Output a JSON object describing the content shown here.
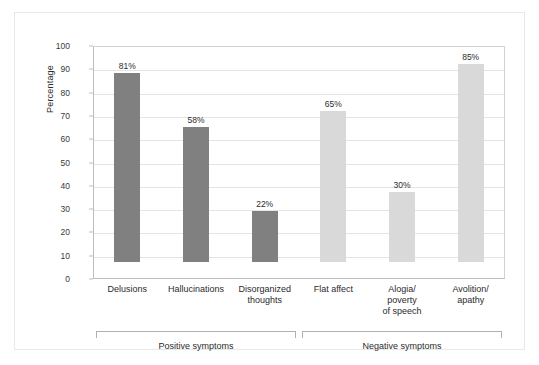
{
  "chart_data": {
    "type": "bar",
    "title": "",
    "xlabel": "",
    "ylabel": "Percentage",
    "ylim": [
      0,
      100
    ],
    "ytick_step": 10,
    "grid": true,
    "legend": "none",
    "categories": [
      "Delusions",
      "Hallucinations",
      "Disorganized thoughts",
      "Flat affect",
      "Alogia/ poverty of speech",
      "Avolition/ apathy"
    ],
    "category_lines": [
      [
        "Delusions"
      ],
      [
        "Hallucinations"
      ],
      [
        "Disorganized",
        "thoughts"
      ],
      [
        "Flat affect"
      ],
      [
        "Alogia/",
        "poverty",
        "of speech"
      ],
      [
        "Avolition/",
        "apathy"
      ]
    ],
    "values": [
      81,
      58,
      22,
      65,
      30,
      85
    ],
    "value_labels": [
      "81%",
      "58%",
      "22%",
      "65%",
      "30%",
      "85%"
    ],
    "ytick_labels": [
      "100",
      "90",
      "80",
      "70",
      "60",
      "50",
      "40",
      "30",
      "20",
      "10",
      "0"
    ],
    "bar_colors": [
      "#808080",
      "#808080",
      "#808080",
      "#d9d9d9",
      "#d9d9d9",
      "#d9d9d9"
    ],
    "groups": [
      {
        "label": "Positive symptoms",
        "from": 0,
        "to": 2
      },
      {
        "label": "Negative symptoms",
        "from": 3,
        "to": 5
      }
    ]
  },
  "colors": {
    "positive_bar": "#808080",
    "negative_bar": "#d9d9d9",
    "gridline": "#e4e4e4",
    "axis": "#bdbdbd",
    "text": "#2b2b2b",
    "frame": "#e8e8e8"
  }
}
